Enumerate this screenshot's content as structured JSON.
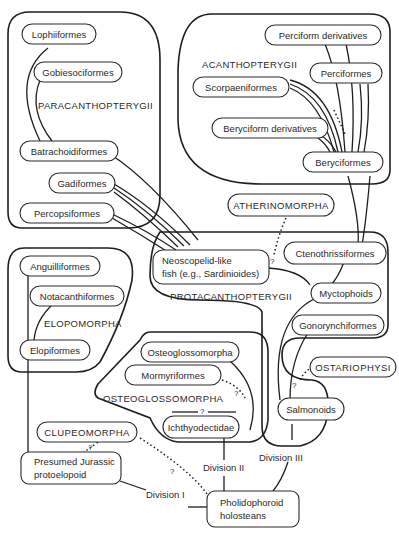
{
  "groups": {
    "paracanthopterygii": "PARACANTHOPTERYGII",
    "acanthopterygii": "ACANTHOPTERYGII",
    "protacanthopterygii": "PROTACANTHOPTERYGII",
    "elopomorpha": "ELOPOMORPHA",
    "osteoglossomorpha": "OSTEOGLOSSOMORPHA"
  },
  "nodes": {
    "lophiiformes": "Lophiiformes",
    "gobiesociformes": "Gobiesociformes",
    "batrachoidiformes": "Batrachoidiformes",
    "gadiformes": "Gadiformes",
    "percopsiformes": "Percopsiformes",
    "perciform_derivatives": "Perciform derivatives",
    "perciformes": "Perciformes",
    "scorpaeniformes": "Scorpaeniformes",
    "beryciform_derivatives": "Beryciform derivatives",
    "beryciformes": "Beryciformes",
    "atherinomorpha": "ATHERINOMORPHA",
    "ctenothrissiformes": "Ctenothrissiformes",
    "neoscopelid_line1": "Neoscopelid-like",
    "neoscopelid_line2": "fish (e.g., Sardinioides)",
    "myctophoids": "Myctophoids",
    "gonorynchiformes": "Gonorynchiformes",
    "ostariophysi": "OSTARIOPHYSI",
    "salmonoids": "Salmonoids",
    "anguilliformes": "Anguilliformes",
    "notacanthiformes": "Notacanthiformes",
    "elopiformes": "Elopiformes",
    "osteoglossomorpha_node": "Osteoglossomorpha",
    "mormyriformes": "Mormyriformes",
    "ichthyodectidae": "Ichthyodectidae",
    "clupeomorpha": "CLUPEOMORPHA",
    "jurassic_line1": "Presumed Jurassic",
    "jurassic_line2": "protoelopoid",
    "pholidophoroid_line1": "Pholidophoroid",
    "pholidophoroid_line2": "holosteans"
  },
  "divisions": {
    "division_1": "Division I",
    "division_2": "Division II",
    "division_3": "Division III"
  },
  "uncertainty_marker": "?"
}
